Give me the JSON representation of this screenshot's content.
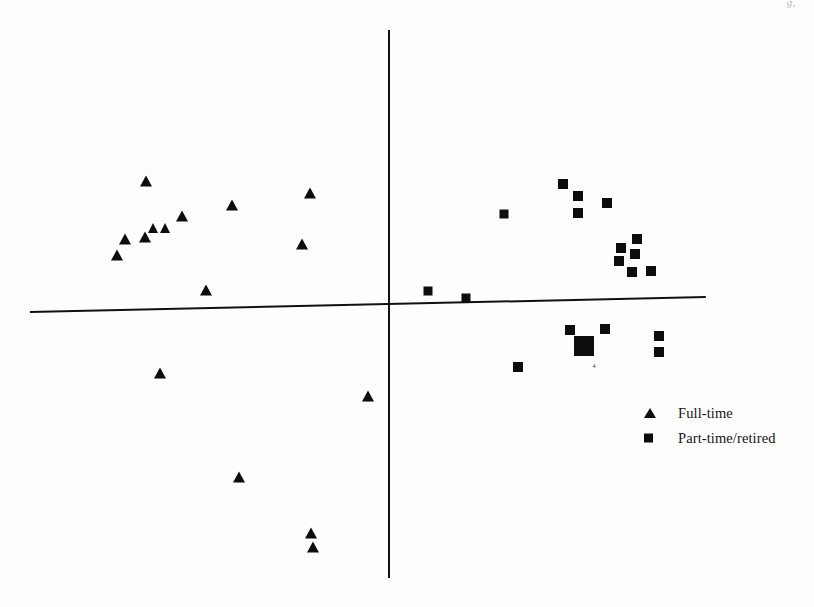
{
  "figure": {
    "width": 814,
    "height": 607,
    "background_color": "#fdfdfd",
    "ink_color": "#0d0d0d",
    "corner_artifact_text": "g,"
  },
  "axes": {
    "x_axis": {
      "x_start": 30,
      "x_end": 706,
      "y_at_start": 311,
      "y_at_end": 296,
      "thickness": 1.6,
      "color": "#111111"
    },
    "y_axis": {
      "x": 388,
      "y_start": 30,
      "y_end": 578,
      "thickness": 1.8,
      "color": "#111111"
    },
    "origin": {
      "x": 389,
      "y": 304
    },
    "ticks": [],
    "tick_labels": [],
    "grid": false,
    "xlabel": "",
    "ylabel": ""
  },
  "legend": {
    "position": "bottom-right",
    "entries": [
      {
        "label": "Full-time",
        "marker": "triangle",
        "color": "#0d0d0d"
      },
      {
        "label": "Part-time/retired",
        "marker": "square",
        "color": "#0d0d0d"
      }
    ]
  },
  "annotations": [
    {
      "text": "4",
      "x": 594,
      "y": 366,
      "note": "overlap count under large square"
    }
  ],
  "chart_data": {
    "type": "scatter",
    "title": "",
    "subtitle": "",
    "xlabel": "",
    "ylabel": "",
    "xlim": [
      30,
      706
    ],
    "ylim": [
      30,
      578
    ],
    "grid": false,
    "legend_position": "bottom-right",
    "axis_origin_px": {
      "x": 389,
      "y": 304
    },
    "note": "Pixel coordinates of plotted markers; y increases downward in image space. Axes are unlabelled (perceptual/correspondence map).",
    "series": [
      {
        "name": "Full-time",
        "marker": "triangle",
        "color": "#0d0d0d",
        "count": 16,
        "points": [
          {
            "x": 146,
            "y": 181,
            "size": 13
          },
          {
            "x": 125,
            "y": 239,
            "size": 12
          },
          {
            "x": 117,
            "y": 255,
            "size": 12
          },
          {
            "x": 145,
            "y": 237,
            "size": 12
          },
          {
            "x": 153,
            "y": 228,
            "size": 11
          },
          {
            "x": 165,
            "y": 228,
            "size": 11
          },
          {
            "x": 182,
            "y": 216,
            "size": 12
          },
          {
            "x": 232,
            "y": 205,
            "size": 12
          },
          {
            "x": 310,
            "y": 193,
            "size": 12
          },
          {
            "x": 302,
            "y": 244,
            "size": 12
          },
          {
            "x": 206,
            "y": 290,
            "size": 12
          },
          {
            "x": 160,
            "y": 373,
            "size": 12
          },
          {
            "x": 368,
            "y": 396,
            "size": 12
          },
          {
            "x": 239,
            "y": 477,
            "size": 12
          },
          {
            "x": 311,
            "y": 533,
            "size": 12
          },
          {
            "x": 313,
            "y": 547,
            "size": 12
          }
        ]
      },
      {
        "name": "Part-time/retired",
        "marker": "square",
        "color": "#0d0d0d",
        "count": 22,
        "points": [
          {
            "x": 504,
            "y": 214,
            "size": 9
          },
          {
            "x": 563,
            "y": 184,
            "size": 10
          },
          {
            "x": 578,
            "y": 196,
            "size": 10
          },
          {
            "x": 578,
            "y": 213,
            "size": 10
          },
          {
            "x": 607,
            "y": 203,
            "size": 10
          },
          {
            "x": 637,
            "y": 239,
            "size": 10
          },
          {
            "x": 621,
            "y": 248,
            "size": 10
          },
          {
            "x": 635,
            "y": 254,
            "size": 10
          },
          {
            "x": 619,
            "y": 261,
            "size": 10
          },
          {
            "x": 632,
            "y": 272,
            "size": 10
          },
          {
            "x": 651,
            "y": 271,
            "size": 10
          },
          {
            "x": 428,
            "y": 291,
            "size": 9
          },
          {
            "x": 466,
            "y": 298,
            "size": 9
          },
          {
            "x": 570,
            "y": 330,
            "size": 10
          },
          {
            "x": 605,
            "y": 329,
            "size": 10
          },
          {
            "x": 584,
            "y": 346,
            "size": 20,
            "overlap_count": 4
          },
          {
            "x": 659,
            "y": 336,
            "size": 10
          },
          {
            "x": 659,
            "y": 352,
            "size": 10
          },
          {
            "x": 518,
            "y": 367,
            "size": 10
          }
        ]
      }
    ]
  }
}
